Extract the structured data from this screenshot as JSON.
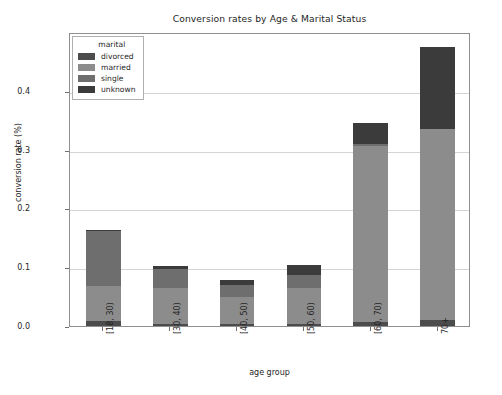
{
  "chart_data": {
    "type": "bar",
    "subtype": "stacked",
    "title": "Conversion rates by Age & Marital Status",
    "xlabel": "age group",
    "ylabel": "conversion rate (%)",
    "categories": [
      "[18, 30)",
      "[30, 40)",
      "[40, 50)",
      "[50, 60)",
      "[60, 70)",
      "70+"
    ],
    "series": [
      {
        "name": "divorced",
        "color": "#4c4c4c",
        "values": [
          0.008,
          0.004,
          0.003,
          0.004,
          0.006,
          0.01
        ]
      },
      {
        "name": "married",
        "color": "#8c8c8c",
        "values": [
          0.06,
          0.06,
          0.047,
          0.06,
          0.3,
          0.325
        ]
      },
      {
        "name": "single",
        "color": "#6e6e6e",
        "values": [
          0.094,
          0.033,
          0.02,
          0.022,
          0.004,
          0.0
        ]
      },
      {
        "name": "unknown",
        "color": "#3b3b3b",
        "values": [
          0.002,
          0.005,
          0.008,
          0.017,
          0.035,
          0.14
        ]
      }
    ],
    "totals": [
      0.164,
      0.102,
      0.078,
      0.103,
      0.345,
      0.475
    ],
    "yticks": [
      "0.0",
      "0.1",
      "0.2",
      "0.3",
      "0.4"
    ],
    "ytick_values": [
      0.0,
      0.1,
      0.2,
      0.3,
      0.4
    ],
    "ylim": [
      0.0,
      0.5
    ],
    "grid": true,
    "legend": {
      "title": "marital",
      "position": "upper left",
      "entries": [
        "divorced",
        "married",
        "single",
        "unknown"
      ]
    }
  },
  "colors": {
    "background": "#ffffff",
    "axis": "#8f8f8f",
    "grid": "#d4d4d4",
    "text": "#262626"
  }
}
